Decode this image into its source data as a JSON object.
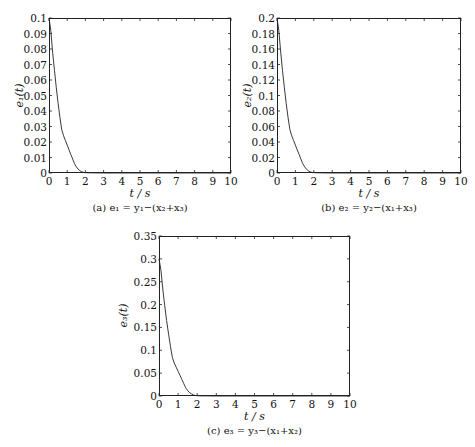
{
  "chart_data": [
    {
      "type": "line",
      "id": "a",
      "caption": "(a) e₁ = y₁−(x₂+x₃)",
      "xlabel": "t / s",
      "ylabel": "e₁(t)",
      "xlim": [
        0,
        10
      ],
      "ylim": [
        0,
        0.1
      ],
      "xticks": [
        "0",
        "1",
        "2",
        "3",
        "4",
        "5",
        "6",
        "7",
        "8",
        "9",
        "10"
      ],
      "yticks": [
        "0",
        "0.01",
        "0.02",
        "0.03",
        "0.04",
        "0.05",
        "0.06",
        "0.07",
        "0.08",
        "0.09",
        "0.1"
      ],
      "grid": false,
      "series": [
        {
          "name": "e1",
          "x": [
            0,
            0.1,
            0.2,
            0.3,
            0.4,
            0.5,
            0.6,
            0.7,
            0.8,
            0.9,
            1.0,
            1.1,
            1.2,
            1.3,
            1.4,
            1.5,
            1.6,
            1.7,
            1.8,
            1.9,
            2.0,
            2.2,
            2.5,
            3,
            10
          ],
          "y": [
            0.1,
            0.092,
            0.078,
            0.066,
            0.055,
            0.045,
            0.036,
            0.028,
            0.024,
            0.021,
            0.018,
            0.015,
            0.012,
            0.009,
            0.006,
            0.004,
            0.0025,
            0.0015,
            0.0008,
            0.0004,
            0.0002,
            0.0001,
            5e-05,
            0,
            0
          ]
        }
      ]
    },
    {
      "type": "line",
      "id": "b",
      "caption": "(b) e₂ = y₂−(x₁+x₃)",
      "xlabel": "t / s",
      "ylabel": "e₂(t)",
      "xlim": [
        0,
        10
      ],
      "ylim": [
        0,
        0.2
      ],
      "xticks": [
        "0",
        "1",
        "2",
        "3",
        "4",
        "5",
        "6",
        "7",
        "8",
        "9",
        "10"
      ],
      "yticks": [
        "0",
        "0.02",
        "0.04",
        "0.06",
        "0.08",
        "0.1",
        "0.12",
        "0.14",
        "0.16",
        "0.18",
        "0.2"
      ],
      "grid": false,
      "series": [
        {
          "name": "e2",
          "x": [
            0,
            0.1,
            0.2,
            0.3,
            0.4,
            0.5,
            0.6,
            0.7,
            0.8,
            0.9,
            1.0,
            1.1,
            1.2,
            1.3,
            1.4,
            1.5,
            1.6,
            1.7,
            1.8,
            1.9,
            2.0,
            2.2,
            2.5,
            3,
            10
          ],
          "y": [
            0.2,
            0.184,
            0.156,
            0.132,
            0.11,
            0.09,
            0.072,
            0.056,
            0.048,
            0.042,
            0.036,
            0.03,
            0.024,
            0.018,
            0.012,
            0.008,
            0.005,
            0.003,
            0.0016,
            0.0008,
            0.0004,
            0.0002,
            0.0001,
            0,
            0
          ]
        }
      ]
    },
    {
      "type": "line",
      "id": "c",
      "caption": "(c) e₃ = y₃−(x₁+x₂)",
      "xlabel": "t / s",
      "ylabel": "e₃(t)",
      "xlim": [
        0,
        10
      ],
      "ylim": [
        0,
        0.35
      ],
      "xticks": [
        "0",
        "1",
        "2",
        "3",
        "4",
        "5",
        "6",
        "7",
        "8",
        "9",
        "10"
      ],
      "yticks": [
        "0",
        "0.05",
        "0.1",
        "0.15",
        "0.2",
        "0.25",
        "0.3",
        "0.35"
      ],
      "grid": false,
      "series": [
        {
          "name": "e3",
          "x": [
            0,
            0.1,
            0.2,
            0.3,
            0.4,
            0.5,
            0.6,
            0.7,
            0.8,
            0.9,
            1.0,
            1.1,
            1.2,
            1.3,
            1.4,
            1.5,
            1.6,
            1.7,
            1.8,
            1.9,
            2.0,
            2.2,
            2.5,
            3,
            10
          ],
          "y": [
            0.3,
            0.276,
            0.234,
            0.198,
            0.165,
            0.135,
            0.108,
            0.084,
            0.072,
            0.063,
            0.054,
            0.045,
            0.036,
            0.027,
            0.018,
            0.012,
            0.0075,
            0.0045,
            0.0024,
            0.0012,
            0.0006,
            0.0003,
            0.00015,
            0,
            0
          ]
        }
      ]
    }
  ],
  "layout": {
    "panels": [
      {
        "frame": [
          49,
          18,
          231,
          173
        ]
      },
      {
        "frame": [
          277,
          18,
          461,
          173
        ]
      },
      {
        "frame": [
          159,
          236,
          350,
          396
        ]
      }
    ]
  }
}
